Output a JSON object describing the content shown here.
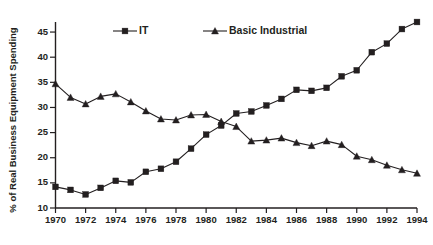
{
  "chart_data": {
    "type": "line",
    "title": "",
    "xlabel": "",
    "ylabel": "% of Real Business Equipment Spending",
    "x": [
      1970,
      1971,
      1972,
      1973,
      1974,
      1975,
      1976,
      1977,
      1978,
      1979,
      1980,
      1981,
      1982,
      1983,
      1984,
      1985,
      1986,
      1987,
      1988,
      1989,
      1990,
      1991,
      1992,
      1993,
      1994
    ],
    "xlim": [
      1970,
      1994
    ],
    "ylim": [
      10,
      47
    ],
    "grid": false,
    "legend_position": "top",
    "xticks": [
      1970,
      1972,
      1974,
      1976,
      1978,
      1980,
      1982,
      1984,
      1986,
      1988,
      1990,
      1992,
      1994
    ],
    "xtick_labels": [
      "1970",
      "1972",
      "1974",
      "1976",
      "1978",
      "1980",
      "1982",
      "1984",
      "1986",
      "1988",
      "1990",
      "1992",
      "1994"
    ],
    "yticks": [
      10,
      15,
      20,
      25,
      30,
      35,
      40,
      45
    ],
    "ytick_labels": [
      "10",
      "15",
      "20",
      "25",
      "30",
      "35",
      "40",
      "45"
    ],
    "series": [
      {
        "name": "IT",
        "marker": "square",
        "color": "#231f20",
        "values": [
          14.2,
          13.6,
          12.7,
          14.0,
          15.4,
          15.1,
          17.2,
          17.8,
          19.2,
          21.8,
          24.6,
          26.4,
          28.8,
          29.2,
          30.4,
          31.7,
          33.5,
          33.3,
          33.9,
          36.2,
          37.4,
          41.0,
          42.7,
          45.6,
          47.0
        ]
      },
      {
        "name": "Basic Industrial",
        "marker": "triangle",
        "color": "#231f20",
        "values": [
          34.7,
          32.0,
          30.7,
          32.2,
          32.7,
          31.1,
          29.3,
          27.7,
          27.5,
          28.5,
          28.6,
          27.2,
          26.2,
          23.3,
          23.5,
          23.9,
          23.0,
          22.4,
          23.3,
          22.6,
          20.3,
          19.6,
          18.5,
          17.6,
          16.9
        ]
      }
    ]
  },
  "legend": {
    "entries": [
      {
        "label": "IT",
        "marker": "square-marker"
      },
      {
        "label": "Basic Industrial",
        "marker": "triangle-marker"
      }
    ]
  }
}
